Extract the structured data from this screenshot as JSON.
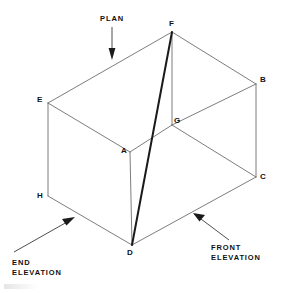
{
  "figure": {
    "type": "isometric-box-projection-diagram",
    "background_color": "#ffffff",
    "edge_color": "#6e6e70",
    "highlight_color": "#1a1a1a",
    "text_color": "#111111",
    "vertices": [
      {
        "id": "A",
        "label": "A",
        "x": 130,
        "y": 152,
        "label_x": 121,
        "label_y": 147
      },
      {
        "id": "B",
        "label": "B",
        "x": 256,
        "y": 84,
        "label_x": 260,
        "label_y": 76
      },
      {
        "id": "C",
        "label": "C",
        "x": 256,
        "y": 177,
        "label_x": 260,
        "label_y": 173
      },
      {
        "id": "D",
        "label": "D",
        "x": 132,
        "y": 245,
        "label_x": 127,
        "label_y": 249
      },
      {
        "id": "E",
        "label": "E",
        "x": 48,
        "y": 103,
        "label_x": 37,
        "label_y": 96
      },
      {
        "id": "F",
        "label": "F",
        "x": 172,
        "y": 32,
        "label_x": 169,
        "label_y": 20
      },
      {
        "id": "G",
        "label": "G",
        "x": 172,
        "y": 125,
        "label_x": 174,
        "label_y": 117
      },
      {
        "id": "H",
        "label": "H",
        "x": 48,
        "y": 196,
        "label_x": 37,
        "label_y": 192
      }
    ],
    "edges": [
      {
        "from": "E",
        "to": "F",
        "weight": "thin"
      },
      {
        "from": "F",
        "to": "B",
        "weight": "thin"
      },
      {
        "from": "E",
        "to": "A",
        "weight": "thin"
      },
      {
        "from": "A",
        "to": "G",
        "weight": "thin"
      },
      {
        "from": "G",
        "to": "B",
        "weight": "thin"
      },
      {
        "from": "F",
        "to": "G",
        "weight": "thin"
      },
      {
        "from": "E",
        "to": "H",
        "weight": "thin"
      },
      {
        "from": "B",
        "to": "C",
        "weight": "thin"
      },
      {
        "from": "A",
        "to": "D",
        "weight": "thin"
      },
      {
        "from": "H",
        "to": "D",
        "weight": "thin"
      },
      {
        "from": "D",
        "to": "C",
        "weight": "thin"
      },
      {
        "from": "G",
        "to": "C",
        "weight": "thin"
      },
      {
        "from": "F",
        "to": "D",
        "weight": "thick"
      }
    ],
    "annotations": [
      {
        "id": "plan",
        "lines": [
          "PLAN"
        ],
        "text_x": 100,
        "text_y": 14,
        "leader_from_x": 112,
        "leader_from_y": 27,
        "leader_to_x": 112,
        "leader_to_y": 57,
        "arrow_direction": "down"
      },
      {
        "id": "end-elevation",
        "lines": [
          "END",
          "ELEVATION"
        ],
        "text_x": 12,
        "text_y": 258,
        "leader_from_x": 14,
        "leader_from_y": 252,
        "leader_to_x": 72,
        "leader_to_y": 219,
        "arrow_direction": "up-right"
      },
      {
        "id": "front-elevation",
        "lines": [
          "FRONT",
          "ELEVATION"
        ],
        "text_x": 211,
        "text_y": 243,
        "leader_from_x": 229,
        "leader_from_y": 240,
        "leader_to_x": 196,
        "leader_to_y": 215,
        "arrow_direction": "up-left"
      }
    ]
  }
}
